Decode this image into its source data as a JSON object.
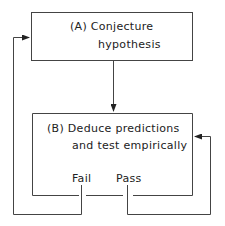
{
  "diagram": {
    "box_a": {
      "line1": "(A)  Conjecture",
      "line2": "hypothesis"
    },
    "box_b": {
      "line1": "(B)  Deduce predictions",
      "line2": "and test empirically"
    },
    "outcomes": {
      "fail": "Fail",
      "pass": "Pass"
    },
    "colors": {
      "line": "#333333",
      "background": "#ffffff"
    }
  }
}
